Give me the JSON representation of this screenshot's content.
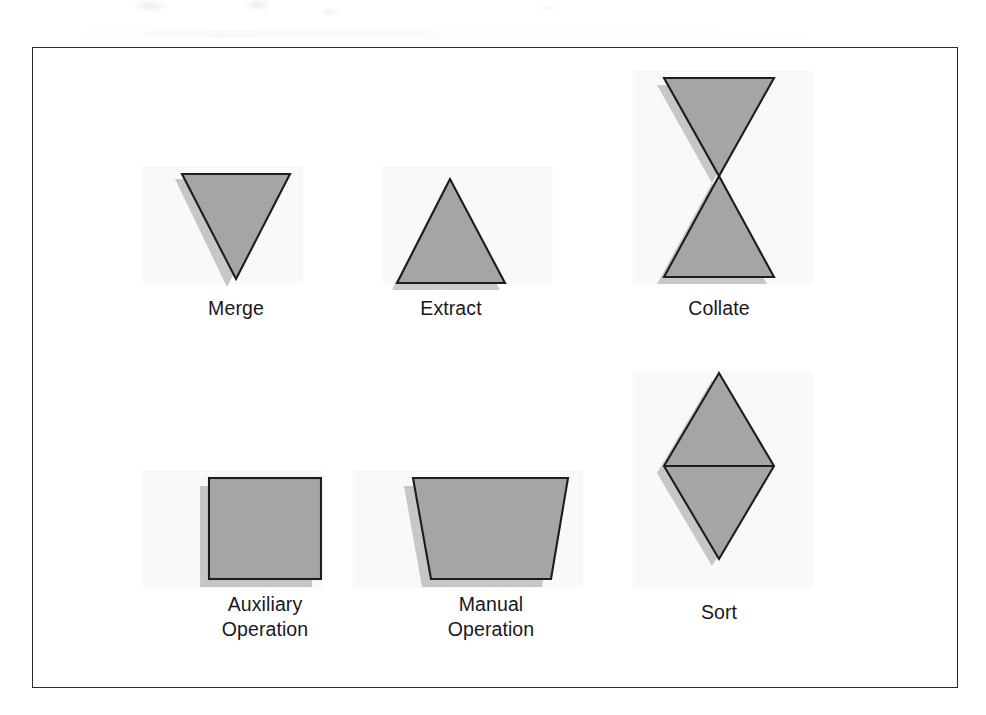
{
  "page": {
    "background_color": "#ffffff",
    "frame": {
      "border_color": "#2b2b30",
      "x": 32,
      "y": 47,
      "width": 926,
      "height": 641
    },
    "palette": {
      "shape_fill": "#a9a9a9",
      "shape_outline": "#1d1d22",
      "shape_shadow": "#cbcbcb",
      "label_color": "#19191d"
    }
  },
  "diagram": {
    "type": "symbol-legend",
    "rows": 2,
    "columns": 3,
    "symbols": [
      {
        "id": "merge",
        "label": "Merge",
        "shape": "triangle-down",
        "row": 1,
        "column": 1,
        "icon_name": "merge-symbol-icon"
      },
      {
        "id": "extract",
        "label": "Extract",
        "shape": "triangle-up",
        "row": 1,
        "column": 2,
        "icon_name": "extract-symbol-icon"
      },
      {
        "id": "collate",
        "label": "Collate",
        "shape": "bowtie",
        "row": 1,
        "column": 3,
        "icon_name": "collate-symbol-icon"
      },
      {
        "id": "auxiliary-operation",
        "label": "Auxiliary\nOperation",
        "shape": "square",
        "row": 2,
        "column": 1,
        "icon_name": "auxiliary-operation-symbol-icon"
      },
      {
        "id": "manual-operation",
        "label": "Manual\nOperation",
        "shape": "trapezoid",
        "row": 2,
        "column": 2,
        "icon_name": "manual-operation-symbol-icon"
      },
      {
        "id": "sort",
        "label": "Sort",
        "shape": "diamond-split",
        "row": 2,
        "column": 3,
        "icon_name": "sort-symbol-icon"
      }
    ]
  }
}
